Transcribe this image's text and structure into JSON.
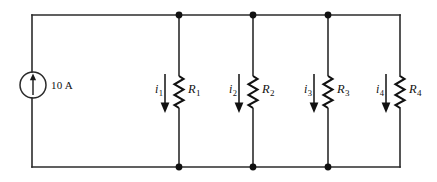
{
  "figure": {
    "background_color": "#ffffff",
    "wire_color": "#2b2b2b",
    "ink_color": "#111111",
    "width": 437,
    "height": 182
  },
  "source": {
    "type": "independent-current-source",
    "symbol": "circle-with-arrow",
    "direction": "up",
    "label": "10 A",
    "value": 10,
    "unit": "A",
    "position": {
      "cx": 33,
      "cy": 85,
      "r": 13
    }
  },
  "rails": {
    "top_y": 15,
    "bottom_y": 167,
    "left_x": 32,
    "right_x": 400
  },
  "nodes": [
    {
      "name": "node-top-1",
      "x": 179,
      "y": 15
    },
    {
      "name": "node-top-2",
      "x": 253,
      "y": 15
    },
    {
      "name": "node-top-3",
      "x": 328,
      "y": 15
    },
    {
      "name": "node-bottom-1",
      "x": 179,
      "y": 167
    },
    {
      "name": "node-bottom-2",
      "x": 253,
      "y": 167
    },
    {
      "name": "node-bottom-3",
      "x": 328,
      "y": 167
    }
  ],
  "branches": [
    {
      "id": "branch-1",
      "x": 179,
      "resistor_label": "R",
      "resistor_sub": "1",
      "current_label": "i",
      "current_sub": "1",
      "current_direction": "down",
      "on_right_edge": false
    },
    {
      "id": "branch-2",
      "x": 253,
      "resistor_label": "R",
      "resistor_sub": "2",
      "current_label": "i",
      "current_sub": "2",
      "current_direction": "down",
      "on_right_edge": false
    },
    {
      "id": "branch-3",
      "x": 328,
      "resistor_label": "R",
      "resistor_sub": "3",
      "current_label": "i",
      "current_sub": "3",
      "current_direction": "down",
      "on_right_edge": false
    },
    {
      "id": "branch-4",
      "x": 400,
      "resistor_label": "R",
      "resistor_sub": "4",
      "current_label": "i",
      "current_sub": "4",
      "current_direction": "down",
      "on_right_edge": true
    }
  ],
  "resistor_geometry": {
    "top_y": 76,
    "bottom_y": 108,
    "amplitude": 4.5,
    "zig_count": 6
  },
  "current_arrow_geometry": {
    "offset_x": -14,
    "top_y": 74,
    "bottom_y": 112
  }
}
